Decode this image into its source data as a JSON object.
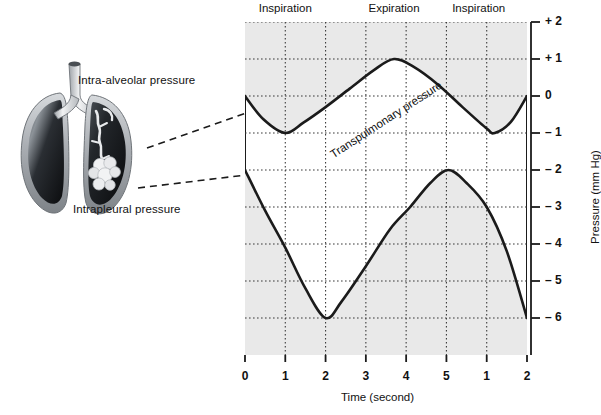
{
  "figure": {
    "illustration": {
      "name": "lungs-illustration",
      "labels": {
        "intra_alveolar": "Intra-alveolar pressure",
        "intrapleural": "Intrapleural pressure"
      }
    },
    "colors": {
      "curve": "#1b1b1b",
      "shade": "#e9e9e9",
      "frame": "#1b1b1b",
      "grid": "#3a3a3a",
      "lung_dark": "#15171a",
      "lung_pleura": "#b9bcc0"
    }
  },
  "chart_data": {
    "type": "line",
    "title": "",
    "xlabel": "Time (second)",
    "ylabel": "Pressure (mm Hg)",
    "xlim": [
      0,
      7
    ],
    "ylim": [
      -7,
      2
    ],
    "grid": true,
    "legend": "none",
    "xtick_positions": [
      0,
      1,
      2,
      3,
      4,
      5,
      6,
      7
    ],
    "xtick_labels": [
      "0",
      "1",
      "2",
      "3",
      "4",
      "5",
      "1",
      "2"
    ],
    "ytick_values": [
      2,
      1,
      0,
      -1,
      -2,
      -3,
      -4,
      -5,
      -6
    ],
    "ytick_labels": [
      "+ 2",
      "+ 1",
      "0",
      "– 1",
      "– 2",
      "– 3",
      "– 4",
      "– 5",
      "– 6"
    ],
    "phase_annotations": [
      {
        "label": "Inspiration",
        "x_start": 0,
        "x_end": 2
      },
      {
        "label": "Expiration",
        "x_start": 2.7,
        "x_end": 4.7
      },
      {
        "label": "Inspiration",
        "x_start": 4.8,
        "x_end": 6.8
      }
    ],
    "curve_annotations": [
      {
        "label": "Transpulmonary pressure",
        "x": 2.05,
        "y": -1.45,
        "rotation_deg": -33
      }
    ],
    "series": [
      {
        "name": "Intra-alveolar pressure",
        "points": [
          {
            "x": 0.0,
            "y": 0.0
          },
          {
            "x": 0.45,
            "y": -0.62
          },
          {
            "x": 1.0,
            "y": -1.0
          },
          {
            "x": 1.45,
            "y": -0.72
          },
          {
            "x": 2.0,
            "y": -0.3
          },
          {
            "x": 2.6,
            "y": 0.2
          },
          {
            "x": 3.2,
            "y": 0.7
          },
          {
            "x": 3.7,
            "y": 1.0
          },
          {
            "x": 4.2,
            "y": 0.78
          },
          {
            "x": 4.8,
            "y": 0.3
          },
          {
            "x": 5.4,
            "y": -0.3
          },
          {
            "x": 6.0,
            "y": -0.88
          },
          {
            "x": 6.2,
            "y": -1.0
          },
          {
            "x": 6.6,
            "y": -0.7
          },
          {
            "x": 7.0,
            "y": 0.0
          }
        ]
      },
      {
        "name": "Intrapleural pressure",
        "points": [
          {
            "x": 0.0,
            "y": -2.0
          },
          {
            "x": 0.5,
            "y": -3.1
          },
          {
            "x": 1.0,
            "y": -4.1
          },
          {
            "x": 1.5,
            "y": -5.2
          },
          {
            "x": 2.0,
            "y": -6.0
          },
          {
            "x": 2.4,
            "y": -5.55
          },
          {
            "x": 3.0,
            "y": -4.6
          },
          {
            "x": 3.6,
            "y": -3.6
          },
          {
            "x": 4.1,
            "y": -3.0
          },
          {
            "x": 4.6,
            "y": -2.35
          },
          {
            "x": 5.05,
            "y": -2.0
          },
          {
            "x": 5.5,
            "y": -2.35
          },
          {
            "x": 6.0,
            "y": -3.0
          },
          {
            "x": 6.5,
            "y": -4.2
          },
          {
            "x": 7.0,
            "y": -6.0
          }
        ]
      }
    ]
  },
  "leader_lines": [
    {
      "name": "leader-intra-alveolar",
      "from": [
        147,
        148
      ],
      "to": [
        246,
        113
      ]
    },
    {
      "name": "leader-intrapleural",
      "from": [
        138,
        188
      ],
      "to": [
        246,
        175
      ]
    }
  ]
}
